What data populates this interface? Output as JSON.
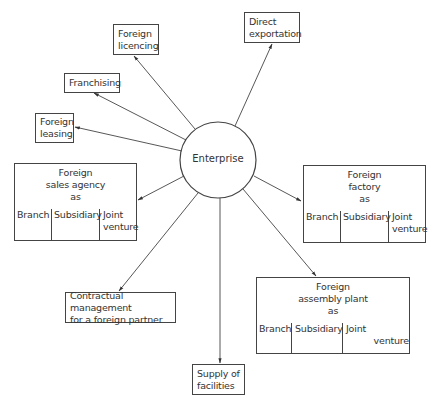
{
  "center": {
    "label": "Enterprise"
  },
  "nodes": {
    "direct_exportation": {
      "lines": [
        "Direct",
        "exportation"
      ]
    },
    "foreign_licencing": {
      "lines": [
        "Foreign",
        "licencing"
      ]
    },
    "franchising": {
      "lines": [
        "Franchising"
      ]
    },
    "foreign_leasing": {
      "lines": [
        "Foreign",
        "leasing"
      ]
    },
    "foreign_sales_agency": {
      "title": [
        "Foreign",
        "sales agency",
        "as"
      ],
      "options": [
        "Branch",
        "Subsidiary",
        "Joint venture"
      ]
    },
    "foreign_factory": {
      "title": [
        "Foreign",
        "factory",
        "as"
      ],
      "options": [
        "Branch",
        "Subsidiary",
        "Joint venture"
      ]
    },
    "contractual_management": {
      "lines": [
        "Contractual management",
        "for a foreign partner"
      ]
    },
    "supply_of_facilities": {
      "lines": [
        "Supply of",
        "facilities"
      ]
    },
    "foreign_assembly_plant": {
      "title": [
        "Foreign",
        "assembly plant",
        "as"
      ],
      "options": [
        "Branch",
        "Subsidiary",
        "Joint venture"
      ]
    }
  },
  "labels": {
    "joint_1": "Joint",
    "venture_1": "venture"
  }
}
